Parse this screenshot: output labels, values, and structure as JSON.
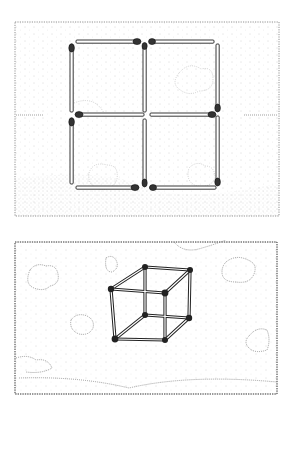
{
  "illustration": {
    "top_panel": {
      "description": "Four squares made of twelve matchsticks (2x2 grid) on a dotted tabletop",
      "matchstick_count": 12,
      "grid": "2x2"
    },
    "bottom_panel": {
      "description": "Matchsticks arranged as a 3D wireframe cube floating among dotted clouds",
      "matchstick_count": 12,
      "shape": "cube"
    },
    "colors": {
      "ink": "#222222",
      "stipple": "#9a9a9a",
      "background": "#ffffff",
      "match_head": "#333333"
    }
  }
}
